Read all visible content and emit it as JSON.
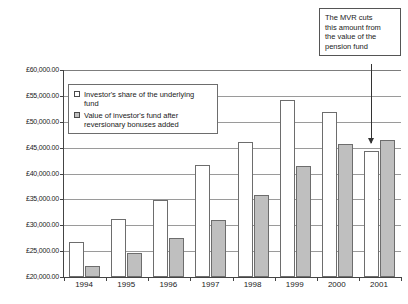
{
  "chart_data": {
    "type": "bar",
    "title": "",
    "subtitle": "",
    "xlabel": "",
    "ylabel": "",
    "ylim": [
      20000,
      60000
    ],
    "ytick_step": 5000,
    "grid": true,
    "legend_position": "inside-top-left",
    "currency_symbol": "£",
    "categories": [
      "1994",
      "1995",
      "1996",
      "1997",
      "1998",
      "1999",
      "2000",
      "2001"
    ],
    "ytick_labels": [
      "£60,000.00",
      "£55,000.00",
      "£50,000.00",
      "£45,000.00",
      "£40,000.00",
      "£35,000.00",
      "£30,000.00",
      "£25,000.00",
      "£20,000.00"
    ],
    "ytick_values": [
      60000,
      55000,
      50000,
      45000,
      40000,
      35000,
      30000,
      25000,
      20000
    ],
    "series": [
      {
        "name": "Investor's share of the underlying fund",
        "style": "light",
        "color": "#ffffff",
        "border_color": "#6d6d6d",
        "values": [
          26800,
          31300,
          34900,
          41600,
          46100,
          54300,
          51800,
          44300
        ]
      },
      {
        "name": "Value of investor's fund after reversionary bonuses added",
        "style": "shaded",
        "color": "#bfbfbf",
        "border_color": "#6d6d6d",
        "values": [
          22100,
          24700,
          27600,
          31100,
          35800,
          41500,
          45700,
          46400
        ]
      }
    ],
    "annotations": [
      {
        "name": "mvr-callout",
        "text": "The MVR cuts this amount from the value of the pension fund",
        "lines": [
          "The MVR cuts",
          "this amount from",
          "the value of the",
          "pension fund"
        ],
        "target_category": "2001",
        "target_series": "Investor's share of the underlying fund"
      }
    ]
  },
  "legend": {
    "items": [
      {
        "swatch": "light",
        "lines": [
          "Investor's share of the underlying",
          "fund"
        ]
      },
      {
        "swatch": "shaded",
        "lines": [
          "Value of investor's fund after",
          "reversionary bonuses added"
        ]
      }
    ]
  },
  "annotation": {
    "line1": "The MVR cuts",
    "line2": "this amount from",
    "line3": "the value of the",
    "line4": "pension fund"
  }
}
